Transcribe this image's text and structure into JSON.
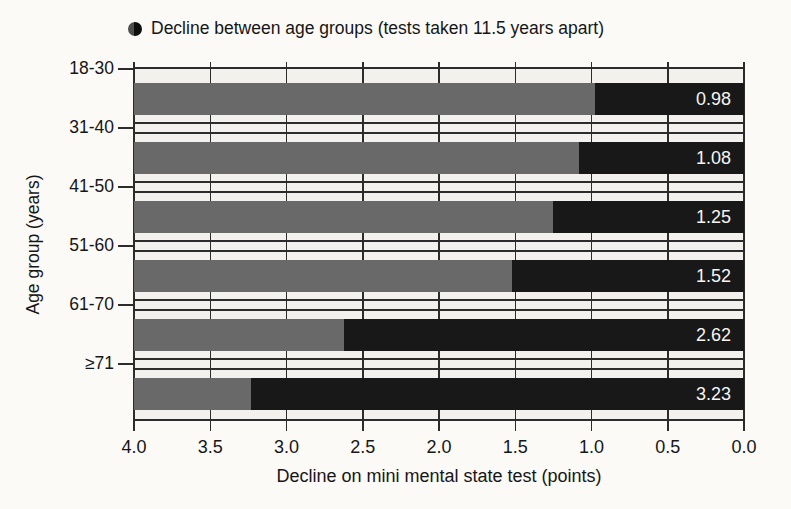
{
  "legend": {
    "marker": "half-filled-circle-icon",
    "label": "Decline between age groups (tests taken 11.5 years apart)"
  },
  "chart_data": {
    "type": "bar",
    "orientation": "horizontal",
    "title": "",
    "legend_label": "Decline between age groups (tests taken 11.5 years apart)",
    "xlabel": "Decline on mini mental state test (points)",
    "ylabel": "Age group (years)",
    "categories": [
      "18-30",
      "31-40",
      "41-50",
      "51-60",
      "61-70",
      "≥71"
    ],
    "values": [
      0.98,
      1.08,
      1.25,
      1.52,
      2.62,
      3.23
    ],
    "value_labels": [
      "0.98",
      "1.08",
      "1.25",
      "1.52",
      "2.62",
      "3.23"
    ],
    "xlim": [
      4.0,
      0.0
    ],
    "x_axis_reversed": true,
    "x_ticks": [
      "4.0",
      "3.5",
      "3.0",
      "2.5",
      "2.0",
      "1.5",
      "1.0",
      "0.5",
      "0.0"
    ],
    "grid": "full",
    "colors": {
      "decline_segment": "#181818",
      "remainder_segment": "#696969",
      "plot_background": "#f2f1ee",
      "line": "#2c2c2c",
      "value_text": "#f5f5f3"
    }
  }
}
